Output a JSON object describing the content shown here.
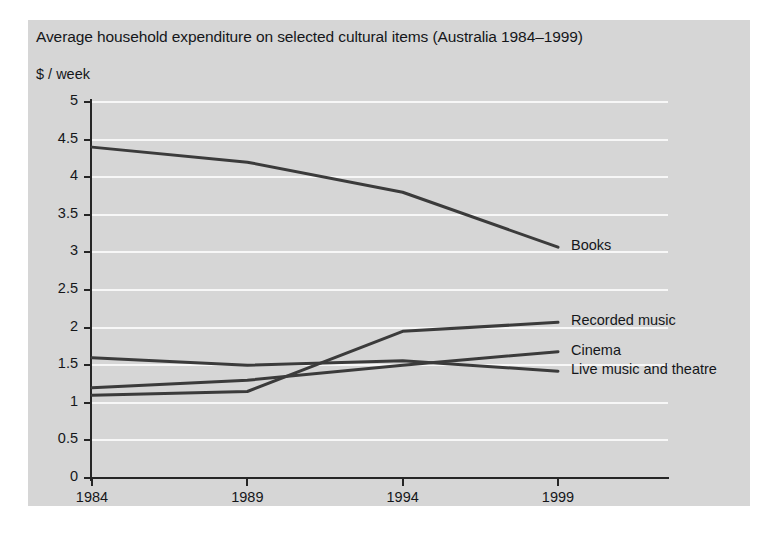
{
  "chart_data": {
    "type": "line",
    "title": "Average household expenditure on selected cultural items (Australia 1984–1999)",
    "ylabel": "$ / week",
    "xlabel": "",
    "x": [
      1984,
      1989,
      1994,
      1999
    ],
    "xticklabels": [
      "1984",
      "1989",
      "1994",
      "1999"
    ],
    "yticks": [
      0,
      0.5,
      1,
      1.5,
      2,
      2.5,
      3,
      3.5,
      4,
      4.5,
      5
    ],
    "yticklabels": [
      "0",
      "0.5",
      "1",
      "1.5",
      "2",
      "2.5",
      "3",
      "3.5",
      "4",
      "4.5",
      "5"
    ],
    "ylim": [
      0,
      5
    ],
    "xlim": [
      1984,
      1999
    ],
    "grid": "horizontal",
    "legend_position": "right-inline-labels",
    "series": [
      {
        "name": "Books",
        "values": [
          4.4,
          4.2,
          3.8,
          3.07
        ]
      },
      {
        "name": "Recorded music",
        "values": [
          1.1,
          1.15,
          1.95,
          2.07
        ]
      },
      {
        "name": "Cinema",
        "values": [
          1.2,
          1.3,
          1.5,
          1.68
        ]
      },
      {
        "name": "Live music and theatre",
        "values": [
          1.6,
          1.5,
          1.56,
          1.42
        ]
      }
    ]
  },
  "colors": {
    "panel_background": "#d6d6d6",
    "gridline": "#f7f7f7",
    "line": "#3b3b3b",
    "axis": "#262626",
    "text": "#15161a",
    "page_background": "#ffffff"
  }
}
